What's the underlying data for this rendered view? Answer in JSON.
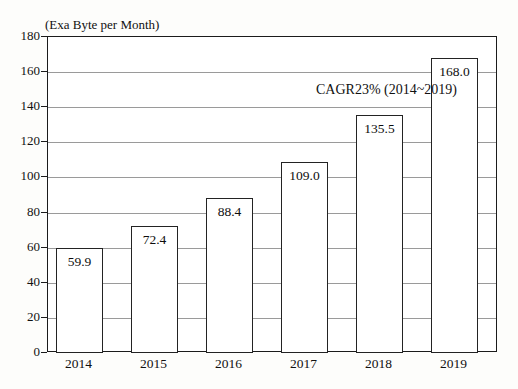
{
  "chart_data": {
    "type": "bar",
    "title": "",
    "subtitle": "",
    "xlabel": "",
    "ylabel": "(Exa Byte per Month)",
    "categories": [
      "2014",
      "2015",
      "2016",
      "2017",
      "2018",
      "2019"
    ],
    "values": [
      59.9,
      72.4,
      88.4,
      109.0,
      135.5,
      168.0
    ],
    "value_labels": [
      "59.9",
      "72.4",
      "88.4",
      "109.0",
      "135.5",
      "168.0"
    ],
    "ylim": [
      0,
      180
    ],
    "ytick_values": [
      0,
      20,
      40,
      60,
      80,
      100,
      120,
      140,
      160,
      180
    ],
    "ytick_labels": [
      "0",
      "20",
      "40",
      "60",
      "80",
      "100",
      "120",
      "140",
      "160",
      "180"
    ],
    "grid": true,
    "grid_orientation": "horizontal",
    "legend": false,
    "legend_position": "none",
    "annotations": [
      {
        "text": "CAGR23% (2014~2019)",
        "position": "top-right-inside-plot"
      }
    ],
    "bar_fill_color": "#ffffff",
    "bar_edge_color": "#232323",
    "gridline_color": "#9a9a9a",
    "axis_color": "#1b1b1b",
    "background_color": "#fdfdfb"
  },
  "axis": {
    "unit_caption": "(Exa Byte per Month)"
  },
  "annotation": {
    "cagr_text": "CAGR23% (2014~2019)"
  }
}
